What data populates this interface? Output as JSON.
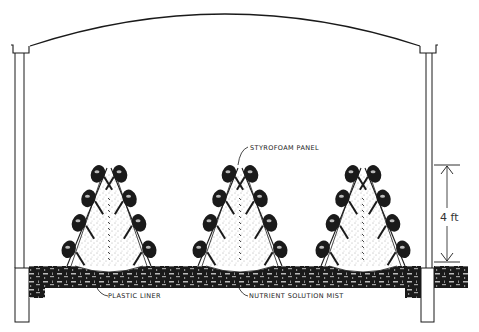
{
  "diagram": {
    "title": "",
    "labels": {
      "panel": "STYROFOAM PANEL",
      "liner": "PLASTIC LINER",
      "mist": "NUTRIENT SOLUTION MIST",
      "height": "4 ft"
    },
    "structures": [
      "greenhouse-arch",
      "left-wall-post",
      "right-wall-post",
      "growing-bed"
    ],
    "a_frames": [
      {
        "name": "a-frame-left"
      },
      {
        "name": "a-frame-center"
      },
      {
        "name": "a-frame-right"
      }
    ],
    "colors": {
      "ink": "#1a1a1a",
      "background": "#ffffff",
      "stipple": "#555555"
    }
  }
}
